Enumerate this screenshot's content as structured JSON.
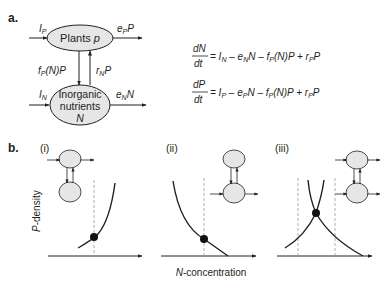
{
  "panel_a": {
    "label": "a.",
    "nodes": {
      "plants": {
        "label": "Plants",
        "var": "p"
      },
      "nutrients": {
        "line1": "Inorganic",
        "line2": "nutrients",
        "var": "N"
      }
    },
    "flows": {
      "I_P": {
        "base": "I",
        "sub": "P"
      },
      "e_P_P": {
        "base": "e",
        "sub": "P",
        "tail": "P"
      },
      "I_N": {
        "base": "I",
        "sub": "N"
      },
      "e_N_N": {
        "base": "e",
        "sub": "N",
        "tail": "N"
      },
      "f_P_N_P": {
        "base": "f",
        "sub": "P",
        "tail": "(N)P"
      },
      "r_N_P": {
        "base": "r",
        "sub": "N",
        "tail": "P"
      }
    },
    "equations": [
      {
        "lhs_num": "dN",
        "lhs_den": "dt",
        "rhs": [
          {
            "t": "= I",
            "s": "N"
          },
          {
            "t": " – e",
            "s": "N"
          },
          {
            "t": "N – f",
            "s": "P"
          },
          {
            "t": "(N)P + r",
            "s": "P"
          },
          {
            "t": "P",
            "s": ""
          }
        ]
      },
      {
        "lhs_num": "dP",
        "lhs_den": "dt",
        "rhs": [
          {
            "t": "= I",
            "s": "P"
          },
          {
            "t": " – e",
            "s": "P"
          },
          {
            "t": "N – f",
            "s": "P"
          },
          {
            "t": "(N)P + r",
            "s": "P"
          },
          {
            "t": "P",
            "s": ""
          }
        ]
      }
    ]
  },
  "panel_b": {
    "label": "b.",
    "subpanels": [
      {
        "label": "(i)"
      },
      {
        "label": "(ii)"
      },
      {
        "label": "(iii)"
      }
    ],
    "ylabel": "P-density",
    "ylabel_italic": "P",
    "ylabel_rest": "-density",
    "xlabel_italic": "N",
    "xlabel_rest": "-concentration"
  },
  "colors": {
    "ink": "#231f20",
    "node_fill": "#e6e6e6",
    "dashed": "#9a9a9a"
  }
}
